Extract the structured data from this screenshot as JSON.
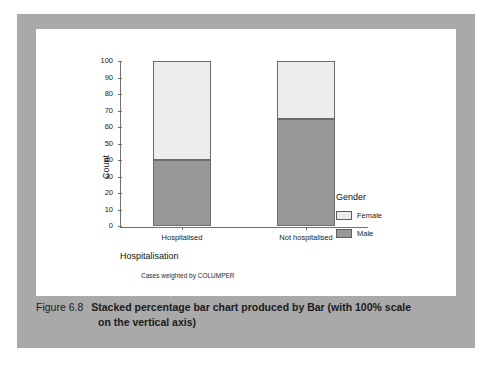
{
  "caption": {
    "label": "Figure 6.8",
    "line1": "Stacked percentage bar chart produced by Bar (with 100% scale",
    "line2": "on the vertical axis)"
  },
  "colors": {
    "frame": "#a9a9a9",
    "page": "#ffffff",
    "female": "#ececec",
    "male": "#989898",
    "outline": "#6b6b6b",
    "axis": "#6f6f6f"
  },
  "footnote": "Cases weighted by COLUMPER",
  "legend": {
    "title": "Gender",
    "position": "right",
    "items": [
      {
        "label": "Female",
        "color": "#ececec"
      },
      {
        "label": "Male",
        "color": "#989898"
      }
    ]
  },
  "chart_data": {
    "type": "bar",
    "stacked": true,
    "title": "",
    "xlabel": "Hospitalisation",
    "ylabel": "Count",
    "categories": [
      "Hospitalised",
      "Not hospitalised"
    ],
    "series": [
      {
        "name": "Male",
        "values": [
          40,
          65
        ],
        "color": "#989898"
      },
      {
        "name": "Female",
        "values": [
          60,
          35
        ],
        "color": "#ececec"
      }
    ],
    "ylim": [
      0,
      100
    ],
    "yticks": [
      0,
      10,
      20,
      30,
      40,
      50,
      60,
      70,
      80,
      90,
      100
    ],
    "ytick_labels": [
      "0",
      "10",
      "20",
      "30",
      "40",
      "50",
      "60",
      "70",
      "80",
      "90",
      "100"
    ],
    "grid": false,
    "totals": [
      100,
      100
    ]
  }
}
